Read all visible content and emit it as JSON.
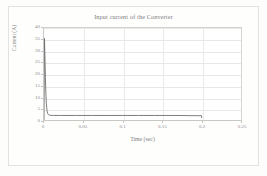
{
  "chart_data": {
    "type": "line",
    "title": "Input current of the Converter",
    "xlabel": "Time (sec)",
    "ylabel": "Current (A)",
    "xlim": [
      0,
      0.25
    ],
    "ylim": [
      0,
      40
    ],
    "grid": true,
    "legend": false,
    "xticks": [
      "0",
      "0.05",
      "0.1",
      "0.15",
      "0.2",
      "0.25"
    ],
    "xtick_values": [
      0,
      0.05,
      0.1,
      0.15,
      0.2,
      0.25
    ],
    "yticks": [
      "0",
      "5",
      "10",
      "15",
      "20",
      "25",
      "30",
      "35",
      "40"
    ],
    "ytick_values": [
      0,
      5,
      10,
      15,
      20,
      25,
      30,
      35,
      40
    ],
    "series": [
      {
        "name": "Input current",
        "color": "#6e6e6e",
        "x": [
          0,
          0.0006,
          0.0012,
          0.0018,
          0.0024,
          0.003,
          0.0038,
          0.0046,
          0.0055,
          0.007,
          0.009,
          0.012,
          0.02,
          0.04,
          0.06,
          0.08,
          0.1,
          0.12,
          0.14,
          0.16,
          0.175,
          0.185,
          0.195,
          0.2,
          0.2
        ],
        "y": [
          0,
          35.5,
          27.0,
          18.5,
          11.5,
          7.0,
          4.2,
          2.9,
          2.35,
          2.1,
          2.0,
          1.98,
          1.97,
          1.97,
          1.97,
          1.97,
          1.97,
          1.97,
          1.97,
          1.97,
          1.95,
          1.9,
          1.88,
          1.88,
          0.9
        ]
      }
    ]
  }
}
